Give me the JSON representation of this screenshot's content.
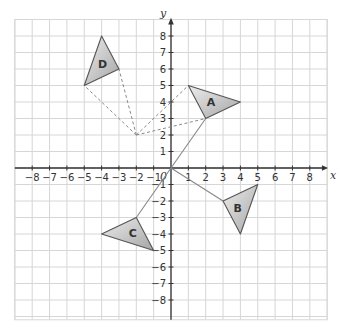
{
  "diagram": {
    "type": "coordinate-grid-transformations",
    "axes": {
      "x_label": "x",
      "y_label": "y",
      "origin_label": "0",
      "x_ticks": [
        -8,
        -7,
        -6,
        -5,
        -4,
        -3,
        -2,
        -1,
        1,
        2,
        3,
        4,
        5,
        6,
        7,
        8
      ],
      "y_ticks": [
        -8,
        -7,
        -6,
        -5,
        -4,
        -3,
        -2,
        -1,
        1,
        2,
        3,
        4,
        5,
        6,
        7,
        8
      ],
      "x_tick_labels": [
        "−8",
        "−7",
        "−6",
        "−5",
        "−4",
        "−3",
        "−2",
        "−1",
        "1",
        "2",
        "3",
        "4",
        "5",
        "6",
        "7",
        "8"
      ],
      "y_tick_labels": [
        "−8",
        "−7",
        "−6",
        "−5",
        "−4",
        "−3",
        "−2",
        "−1",
        "1",
        "2",
        "3",
        "4",
        "5",
        "6",
        "7",
        "8"
      ],
      "grid_range": {
        "xmin": -9,
        "xmax": 9,
        "ymin": -9.2,
        "ymax": 9
      }
    },
    "triangles": [
      {
        "label": "A",
        "vertices": [
          [
            1,
            5
          ],
          [
            4,
            4
          ],
          [
            2,
            3
          ]
        ],
        "label_pos": [
          2.3,
          4
        ]
      },
      {
        "label": "B",
        "vertices": [
          [
            3,
            -2
          ],
          [
            5,
            -1
          ],
          [
            4,
            -4
          ]
        ],
        "label_pos": [
          3.85,
          -2.45
        ]
      },
      {
        "label": "C",
        "vertices": [
          [
            -2,
            -3
          ],
          [
            -4,
            -4
          ],
          [
            -1,
            -5
          ]
        ],
        "label_pos": [
          -2.2,
          -3.95
        ]
      },
      {
        "label": "D",
        "vertices": [
          [
            -4,
            8
          ],
          [
            -3,
            6
          ],
          [
            -5,
            5
          ]
        ],
        "label_pos": [
          -3.95,
          6.3
        ]
      }
    ],
    "solid_lines": [
      {
        "from": [
          0,
          0
        ],
        "to": [
          2,
          3
        ]
      },
      {
        "from": [
          0,
          0
        ],
        "to": [
          3,
          -2
        ]
      },
      {
        "from": [
          0,
          0
        ],
        "to": [
          -2,
          -3
        ]
      }
    ],
    "dashed_lines": [
      {
        "from": [
          -2,
          2
        ],
        "to": [
          -5,
          5
        ]
      },
      {
        "from": [
          -2,
          2
        ],
        "to": [
          -3,
          6
        ]
      },
      {
        "from": [
          -2,
          2
        ],
        "to": [
          1,
          5
        ]
      },
      {
        "from": [
          -2,
          2
        ],
        "to": [
          2,
          3
        ]
      }
    ],
    "colors": {
      "grid": "#d6d6d6",
      "axis": "#333333",
      "triangle_fill_light": "#e8e8e8",
      "triangle_fill_dark": "#a8a8a8",
      "triangle_stroke": "#555555",
      "line": "#888888"
    }
  }
}
